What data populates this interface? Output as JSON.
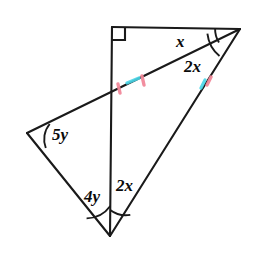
{
  "figure": {
    "type": "geometry-diagram",
    "background_color": "#ffffff",
    "stroke_color": "#1a1a1a",
    "stroke_width": 2.1,
    "tick_colors": {
      "pink": "#f2899a",
      "cyan": "#49d6e8"
    },
    "vertices": [
      {
        "name": "top-left-vertex",
        "id": "T",
        "x": 112,
        "y": 27
      },
      {
        "name": "right-vertex",
        "id": "R",
        "x": 240,
        "y": 29
      },
      {
        "name": "left-vertex",
        "id": "L",
        "x": 27,
        "y": 133
      },
      {
        "name": "bottom-vertex",
        "id": "B",
        "x": 110,
        "y": 236
      },
      {
        "name": "intersection-point",
        "id": "P",
        "x": 112,
        "y": 93
      }
    ],
    "segments": [
      {
        "name": "top-edge",
        "from": "T",
        "to": "R"
      },
      {
        "name": "vertical-edge",
        "from": "T",
        "to": "B"
      },
      {
        "name": "cevian-left-to-right",
        "from": "L",
        "to": "R"
      },
      {
        "name": "left-lower-edge",
        "from": "L",
        "to": "B"
      },
      {
        "name": "bottom-right-edge",
        "from": "B",
        "to": "R"
      }
    ],
    "right_angle": {
      "name": "right-angle-marker",
      "at": "T",
      "size": 13
    },
    "angle_labels": [
      {
        "name": "angle-label-x",
        "text": "x",
        "x": 180,
        "y": 42,
        "at_vertex": "R",
        "position": "upper"
      },
      {
        "name": "angle-label-2x-right",
        "text": "2x",
        "x": 190,
        "y": 68,
        "at_vertex": "R",
        "position": "lower"
      },
      {
        "name": "angle-label-5y",
        "text": "5y",
        "x": 55,
        "y": 136,
        "at_vertex": "L",
        "position": "interior"
      },
      {
        "name": "angle-label-4y",
        "text": "4y",
        "x": 91,
        "y": 197,
        "at_vertex": "B",
        "position": "left"
      },
      {
        "name": "angle-label-2x-bottom",
        "text": "2x",
        "x": 121,
        "y": 187,
        "at_vertex": "B",
        "position": "right"
      }
    ],
    "angle_arcs": [
      {
        "name": "arc-x-at-right-vertex",
        "vertex": "R",
        "radius": 25
      },
      {
        "name": "arc-2x-at-right-vertex",
        "vertex": "R",
        "radius": 34
      },
      {
        "name": "arc-5y-at-left-vertex",
        "vertex": "L",
        "radius": 24
      },
      {
        "name": "arc-4y-at-bottom-vertex",
        "vertex": "B",
        "radius": 30
      },
      {
        "name": "arc-2x-at-bottom-vertex",
        "vertex": "B",
        "radius": 26
      }
    ],
    "tick_marks": [
      {
        "name": "tick-on-cevian-left",
        "x": 119,
        "y": 88,
        "color": "pink"
      },
      {
        "name": "tick-on-cevian-mid",
        "x": 132,
        "y": 84,
        "color": "cyan"
      },
      {
        "name": "tick-on-cevian-right",
        "x": 143,
        "y": 81,
        "color": "pink"
      },
      {
        "name": "tick-on-bottom-right-edge-cyan",
        "x": 203,
        "y": 84,
        "color": "cyan"
      },
      {
        "name": "tick-on-bottom-right-edge-pink",
        "x": 209,
        "y": 80,
        "color": "pink"
      }
    ]
  }
}
